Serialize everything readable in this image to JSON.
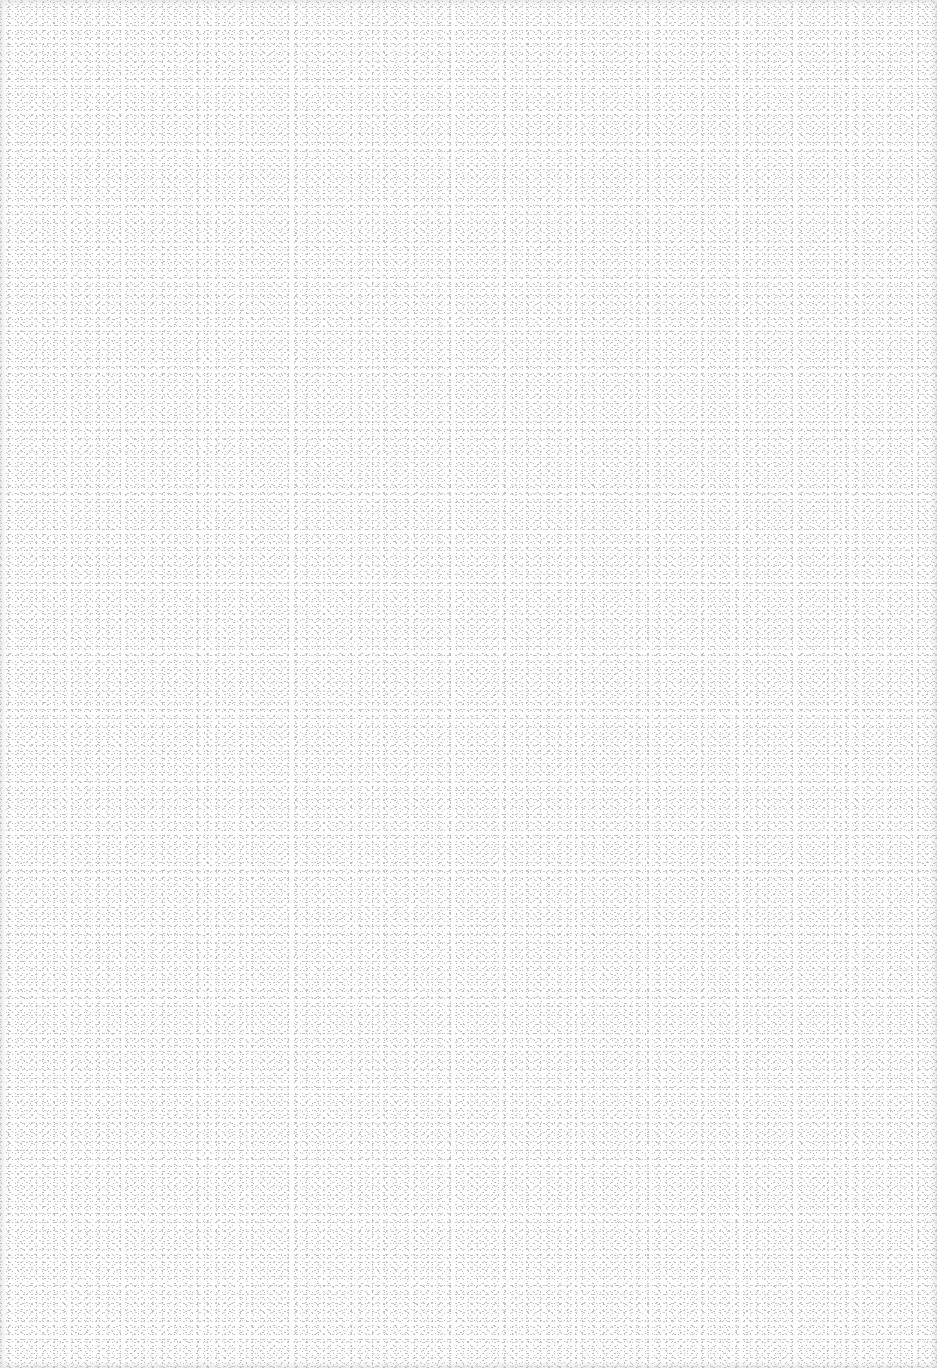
{
  "canvas": {
    "width": 937,
    "height": 1368,
    "description": "blank speckled paper texture",
    "background_color": "#fdfdfd",
    "speckle_color": "#c0c0c0"
  }
}
